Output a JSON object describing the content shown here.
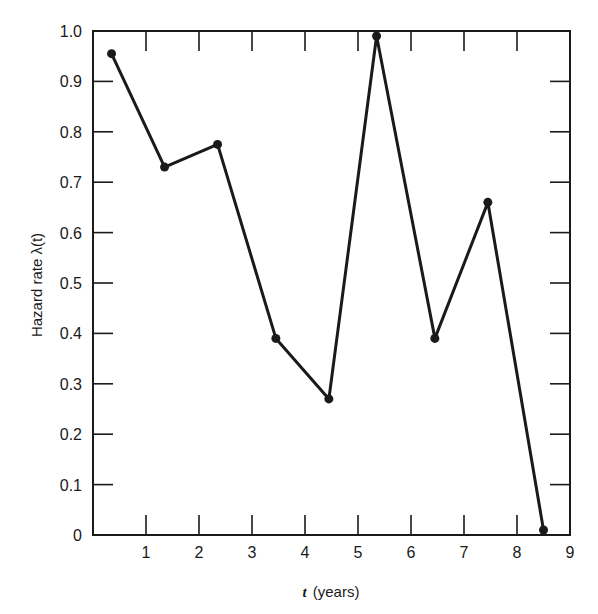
{
  "chart_data": {
    "type": "line",
    "title": "",
    "xlabel": "t (years)",
    "xlabel_var": "t",
    "xlabel_unit": "(years)",
    "ylabel": "Hazard rate λ(t)",
    "xlim": [
      0,
      9
    ],
    "ylim": [
      0,
      1.0
    ],
    "xticks": [
      1,
      2,
      3,
      4,
      5,
      6,
      7,
      8,
      9
    ],
    "xtick_labels": [
      "1",
      "2",
      "3",
      "4",
      "5",
      "6",
      "7",
      "8",
      "9"
    ],
    "yticks": [
      0,
      0.1,
      0.2,
      0.3,
      0.4,
      0.5,
      0.6,
      0.7,
      0.8,
      0.9,
      1.0
    ],
    "ytick_labels": [
      "0",
      "0.1",
      "0.2",
      "0.3",
      "0.4",
      "0.5",
      "0.6",
      "0.7",
      "0.8",
      "0.9",
      "1.0"
    ],
    "grid": false,
    "legend": null,
    "marker": "filled-circle",
    "line_color": "#1a1a1a",
    "series": [
      {
        "name": "Hazard rate λ(t)",
        "x": [
          0.35,
          1.35,
          2.35,
          3.45,
          4.45,
          5.35,
          6.45,
          7.45,
          8.5
        ],
        "values": [
          0.955,
          0.73,
          0.775,
          0.39,
          0.27,
          0.99,
          0.39,
          0.66,
          0.01
        ]
      }
    ]
  }
}
